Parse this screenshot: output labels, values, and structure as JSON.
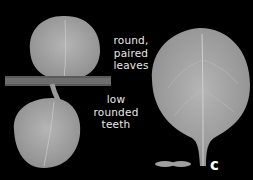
{
  "figure": {
    "panel_letter": "c",
    "labels": {
      "upper": [
        "round,",
        "paired",
        "leaves"
      ],
      "lower": [
        "low",
        "rounded",
        "teeth"
      ]
    },
    "colors": {
      "background": "#000000",
      "leaf": "#a9a9a9",
      "text": "#e8e8e8"
    }
  }
}
